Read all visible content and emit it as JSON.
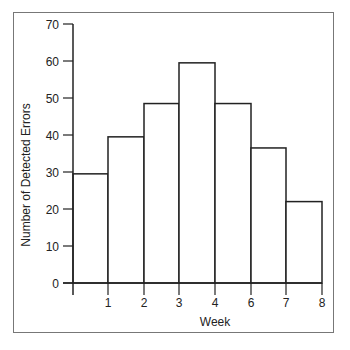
{
  "chart_data": {
    "type": "bar",
    "subtype": "histogram",
    "title": "",
    "xlabel": "Week",
    "ylabel": "Number of Detected Errors",
    "x_tick_labels": [
      "1",
      "2",
      "3",
      "4",
      "6",
      "7",
      "8"
    ],
    "categories": [
      "0-1",
      "1-2",
      "2-3",
      "3-4",
      "4-6",
      "6-7",
      "7-8"
    ],
    "values": [
      29.5,
      39.5,
      48.5,
      59.5,
      48.5,
      36.5,
      22
    ],
    "y_ticks": [
      0,
      10,
      20,
      30,
      40,
      50,
      60,
      70
    ],
    "ylim": [
      0,
      70
    ],
    "grid": false,
    "legend": null,
    "bar_fill": "#ffffff",
    "bar_edge": "#222222"
  }
}
